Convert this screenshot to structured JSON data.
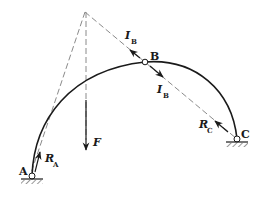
{
  "diagram": {
    "type": "three-hinged arch force diagram",
    "points": {
      "A": {
        "label": "A",
        "x": 32,
        "y": 176
      },
      "B": {
        "label": "B",
        "x": 145,
        "y": 62
      },
      "C": {
        "label": "C",
        "x": 237,
        "y": 139
      },
      "apex": {
        "x": 85,
        "y": 12
      }
    },
    "forces": {
      "F": {
        "symbol": "F",
        "sub": ""
      },
      "RA": {
        "symbol": "R",
        "sub": "A"
      },
      "RC": {
        "symbol": "R",
        "sub": "C"
      },
      "IB_upper": {
        "symbol": "I",
        "sub": "B"
      },
      "IB_lower": {
        "symbol": "I",
        "sub": "B"
      }
    },
    "colors": {
      "line": "#1a1a1a",
      "dashed": "#8a8a8a"
    }
  }
}
